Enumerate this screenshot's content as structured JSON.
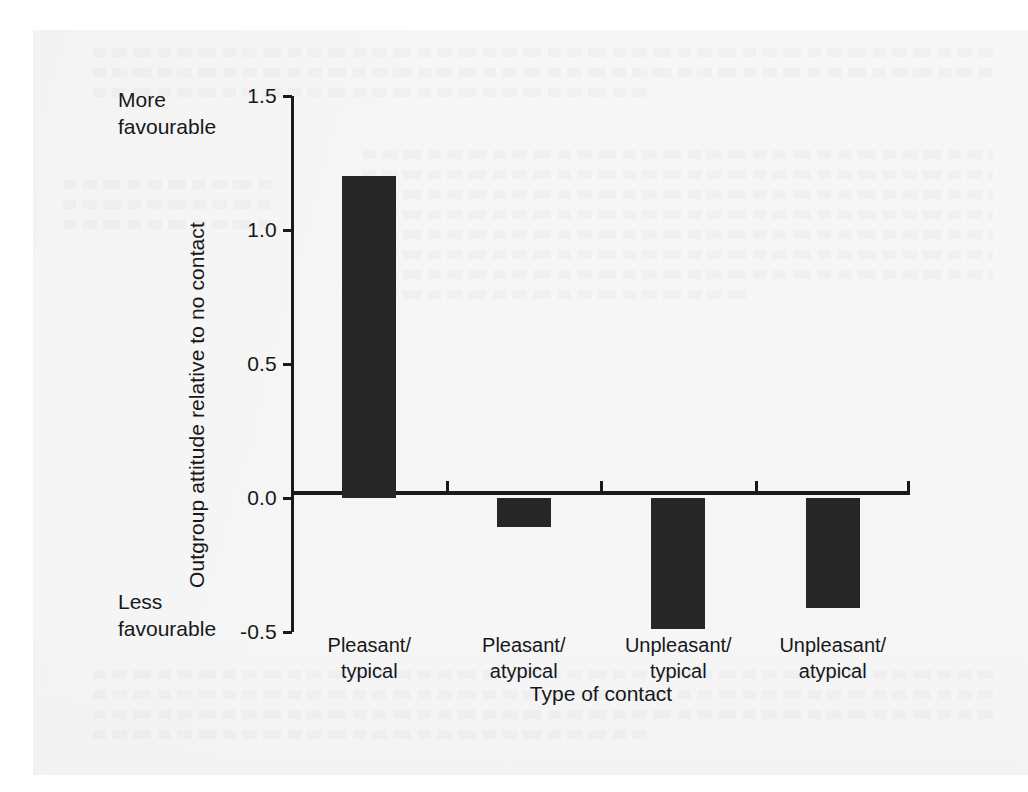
{
  "figure": {
    "background_color": "#f6f6f6",
    "bar_color": "#262626",
    "axis_color": "#1a1a1a"
  },
  "annotations": {
    "more_favourable": "More\nfavourable",
    "less_favourable": "Less\nfavourable"
  },
  "chart_data": {
    "type": "bar",
    "title": "",
    "xlabel": "Type of contact",
    "ylabel": "Outgroup attitude relative to no contact",
    "categories": [
      "Pleasant/\ntypical",
      "Pleasant/\natypical",
      "Unpleasant/\ntypical",
      "Unpleasant/\natypical"
    ],
    "values": [
      1.2,
      -0.11,
      -0.49,
      -0.41
    ],
    "ylim": [
      -0.5,
      1.5
    ],
    "yticks": [
      1.5,
      1.0,
      0.5,
      0.0,
      -0.5
    ],
    "ytick_labels": [
      "1.5",
      "1.0",
      "0.5",
      "0.0",
      "-0.5"
    ],
    "grid": false,
    "legend": null,
    "annotations": [
      "More favourable",
      "Less favourable"
    ],
    "baseline": 0.0
  }
}
